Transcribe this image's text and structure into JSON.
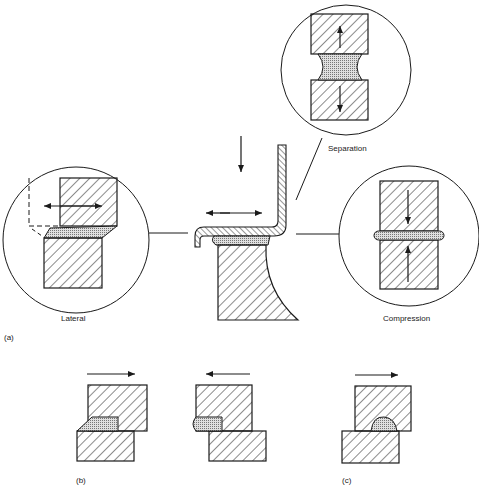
{
  "figure": {
    "panels": {
      "a": {
        "label": "(a)",
        "insets": {
          "separation": {
            "label": "Separation"
          },
          "lateral": {
            "label": "Lateral"
          },
          "compression": {
            "label": "Compression"
          }
        }
      },
      "b": {
        "label": "(b)"
      },
      "c": {
        "label": "(c)"
      }
    },
    "colors": {
      "line": "#1a1a1a",
      "fill_stipple": "#c8c8c8",
      "background": "#ffffff"
    }
  }
}
